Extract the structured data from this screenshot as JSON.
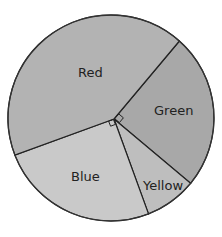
{
  "chart_data": {
    "type": "pie",
    "title": "",
    "categories": [
      "Red",
      "Green",
      "Yellow",
      "Blue"
    ],
    "values_degrees": [
      150,
      90,
      30,
      90
    ],
    "values_percent": [
      41.7,
      25,
      8.3,
      25
    ],
    "right_angle_markers": [
      "Green",
      "Blue"
    ],
    "legend": "none (labels inside slices)",
    "slice_fills": {
      "Red": "#b3b3b3",
      "Green": "#a8a8a8",
      "Yellow": "#bebebe",
      "Blue": "#c9c9c9"
    }
  },
  "labels": {
    "red": "Red",
    "green": "Green",
    "yellow": "Yellow",
    "blue": "Blue"
  }
}
